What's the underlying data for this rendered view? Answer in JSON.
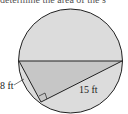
{
  "caption": "determine the area of the s",
  "diagram": {
    "shape": "circle with inscribed right triangle",
    "hypotenuse": "diameter",
    "labels": {
      "leg_short": "8 ft",
      "leg_long": "15 ft"
    },
    "colors": {
      "circle_fill": "#dcdcdc",
      "triangle_fill": "#c4c4c4",
      "stroke": "#222222"
    }
  }
}
